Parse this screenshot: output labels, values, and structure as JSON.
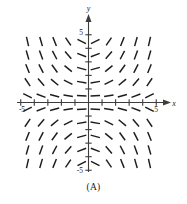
{
  "figure": {
    "caption": "(A)",
    "type": "slope-field"
  },
  "axes": {
    "x_label": "x",
    "y_label": "y",
    "x_tick_positive_label": "5",
    "x_tick_negative_label": "-5",
    "y_tick_positive_label": "5",
    "y_tick_negative_label": "-5",
    "origin_label": ""
  },
  "colors": {
    "axis": "#3d3d3d",
    "dash": "#1c1c1c",
    "background": "#ffffff",
    "text": "#1a1a1a"
  },
  "chart_data": {
    "type": "scatter",
    "title": "(A)",
    "subtitle": "",
    "xlabel": "x",
    "ylabel": "y",
    "xlim": [
      -6.0,
      6.0
    ],
    "ylim": [
      -6.0,
      6.0
    ],
    "grid": false,
    "legend": null,
    "annotations": [
      "(A)"
    ],
    "x_ticks": [
      -5,
      -4,
      -3,
      -2,
      -1,
      1,
      2,
      3,
      4,
      5
    ],
    "y_ticks": [
      -5,
      -4,
      -3,
      -2,
      -1,
      1,
      2,
      3,
      4,
      5
    ],
    "x_tick_labels": [
      "-5",
      "",
      "",
      "",
      "",
      "",
      "",
      "",
      "",
      "5"
    ],
    "y_tick_labels": [
      "-5",
      "",
      "",
      "",
      "",
      "",
      "",
      "",
      "",
      "5"
    ],
    "field_equation": "dy/dx = x*y",
    "dash_grid_x": [
      -4.5,
      -3.5,
      -2.5,
      -1.5,
      -0.5,
      0.5,
      1.5,
      2.5,
      3.5,
      4.5
    ],
    "dash_grid_y": [
      -4.5,
      -3.5,
      -2.5,
      -1.5,
      -0.5,
      0.5,
      1.5,
      2.5,
      3.5,
      4.5
    ],
    "dash_length_px": 9.5,
    "slope_scale": 0.22,
    "series": [
      {
        "name": "slope segments",
        "description": "Short line segments whose slope equals x*y at each grid point; positive slope in quadrants I and III, negative slope in quadrants II and IV, steepening away from the axes.",
        "values": []
      }
    ]
  }
}
